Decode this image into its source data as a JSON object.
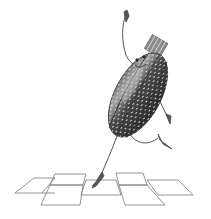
{
  "image": {
    "description": "Pencil illustration of an anthropomorphic striped seed/beetle character hopping over a hopscotch grid",
    "subject": "seed-beetle character",
    "action": "playing hopscotch",
    "style": "grayscale pencil sketch",
    "colors": {
      "background": "#ffffff",
      "body_dark": "#3a3a3a",
      "body_mid": "#6e6e6e",
      "body_highlight": "#b8b8b8",
      "speckle": "#d8d8d8",
      "line": "#555555",
      "grid_line": "#7a7a7a"
    },
    "hopscotch": {
      "squares": 8
    }
  }
}
